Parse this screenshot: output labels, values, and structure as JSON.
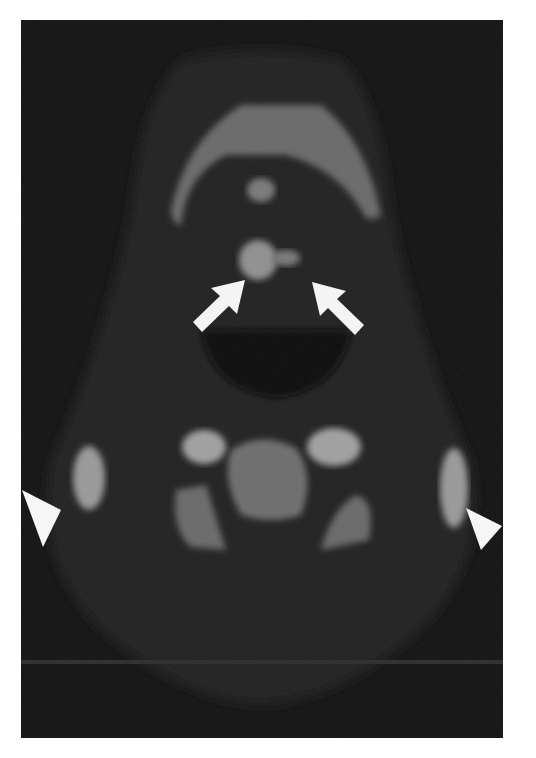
{
  "image": {
    "type": "axial CT slice of neck",
    "background_color": "#111111",
    "annotations": [
      {
        "kind": "arrow",
        "side": "left",
        "pointing": "up-right",
        "color": "#ffffff"
      },
      {
        "kind": "arrow",
        "side": "right",
        "pointing": "up-left",
        "color": "#ffffff"
      },
      {
        "kind": "arrowhead",
        "side": "left",
        "pointing": "right",
        "color": "#ffffff"
      },
      {
        "kind": "arrowhead",
        "side": "right",
        "pointing": "left",
        "color": "#ffffff"
      }
    ]
  }
}
